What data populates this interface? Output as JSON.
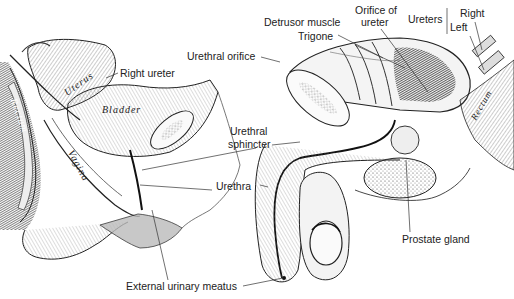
{
  "figure": {
    "female_panel": {
      "labels": {
        "right_ureter": "Right ureter",
        "urethral_sphincter_line1": "Urethral",
        "urethral_sphincter_line2": "sphincter",
        "urethra": "Urethra",
        "external_urinary_meatus": "External urinary meatus"
      },
      "inline_labels": {
        "uterus": "Uterus",
        "bladder": "Bladder",
        "vagina": "Vagina",
        "rectum": "Rectum"
      }
    },
    "male_panel": {
      "labels": {
        "urethral_orifice": "Urethral orifice",
        "detrusor_muscle": "Detrusor muscle",
        "trigone": "Trigone",
        "orifice_of_ureter_line1": "Orifice of",
        "orifice_of_ureter_line2": "ureter",
        "ureters": "Ureters",
        "right": "Right",
        "left": "Left",
        "prostate_gland": "Prostate gland"
      },
      "inline_labels": {
        "rectum": "Rectum"
      }
    },
    "colors": {
      "ink": "#222222",
      "background": "#ffffff",
      "shade_dark": "#1a1a1a",
      "shade_mid": "#8a8a8a",
      "shade_light": "#d9d9d9"
    }
  }
}
